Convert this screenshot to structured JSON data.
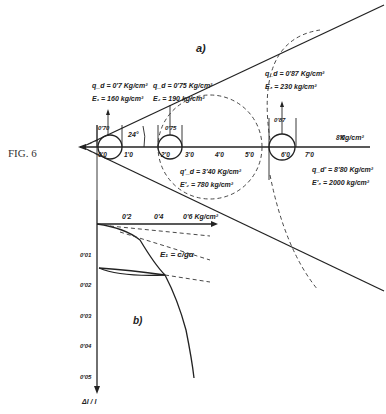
{
  "figure_label": "FIG. 6",
  "panel_a": {
    "label": "a)",
    "angle_label": "24°",
    "axis_unit": "Kg/cm²",
    "axis_ticks": [
      "0'0",
      "1'0",
      "2'0",
      "3'0",
      "4'0",
      "5'0",
      "6'0",
      "7'0",
      "8'0"
    ],
    "circles": [
      {
        "qd": "q_d = 0'7 Kg/cm²",
        "E": "E₁ = 160 kg/cm²",
        "width": "0'70"
      },
      {
        "qd": "q_d = 0'75 Kg/cm²",
        "E": "E₂ = 190 kg/cm²",
        "width": "0'75"
      },
      {
        "qd": "q_d = 0'87 Kg/cm²",
        "E": "E₃ = 230 kg/cm²",
        "width": "0'87"
      }
    ],
    "dashed_circles": [
      {
        "qd": "q'_d = 3'40 Kg/cm²",
        "E": "E'₂ = 780 kg/cm²"
      },
      {
        "qd": "q_d' = 8'80 Kg/cm²",
        "E": "E'₃ = 2000 kg/cm²"
      }
    ]
  },
  "panel_b": {
    "label": "b)",
    "x_ticks": [
      "0'2",
      "0'4",
      "0'6 Kg/cm²"
    ],
    "y_ticks": [
      "0'01",
      "0'02",
      "0'03",
      "0'04",
      "0'05"
    ],
    "y_axis_label": "Δl / l",
    "curve_label": "E₁ = c/gα"
  }
}
